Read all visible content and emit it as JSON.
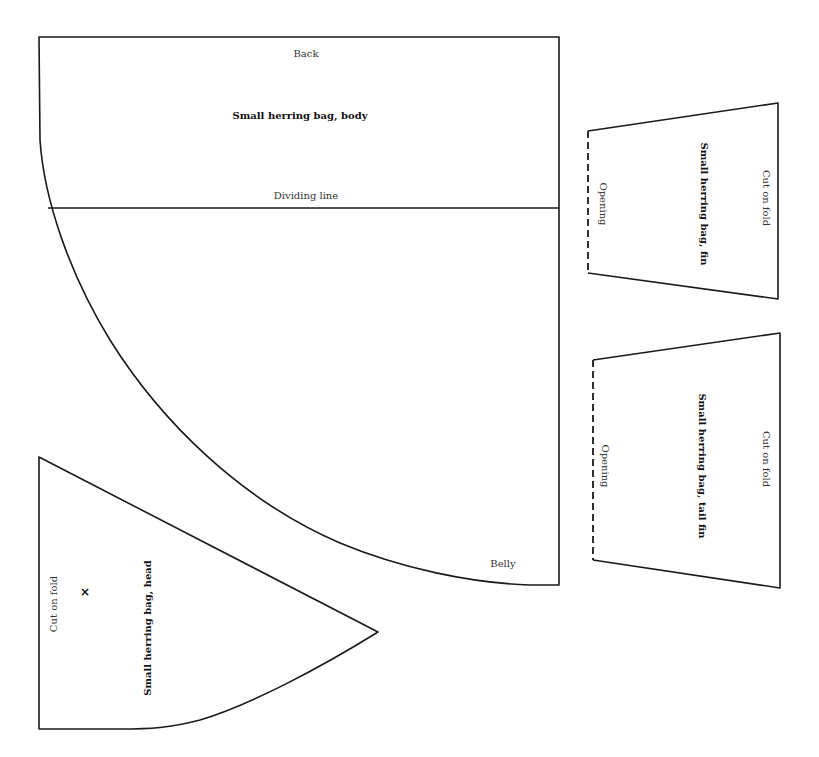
{
  "pattern": {
    "pieces": {
      "body": {
        "title": "Small herring bag, body",
        "top_edge_label": "Back",
        "divider_label": "Dividing line",
        "bottom_edge_label": "Belly"
      },
      "fin": {
        "title": "Small herring bag, fin",
        "fold_label": "Cut on fold",
        "opening_label": "Opening"
      },
      "tail_fin": {
        "title": "Small herring bag, tail fin",
        "fold_label": "Cut on fold",
        "opening_label": "Opening"
      },
      "head": {
        "title": "Small herring bag, head",
        "fold_label": "Cut on fold",
        "eye_mark": "×"
      }
    },
    "colors": {
      "line": "#1a1a1a",
      "background": "#ffffff"
    }
  }
}
